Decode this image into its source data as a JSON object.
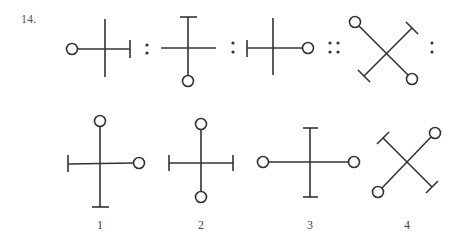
{
  "question": {
    "number": "14.",
    "stroke_color": "#333333",
    "background": "#ffffff"
  },
  "analogy": {
    "separators": [
      ":",
      ":",
      "::",
      ":"
    ],
    "figures": [
      {
        "id": "A",
        "description": "plus sign; circle at left end, bar cap at right end, vertical arm plain"
      },
      {
        "id": "B",
        "description": "plus sign; bar cap at top, circle at bottom, horizontal arm plain"
      },
      {
        "id": "C",
        "description": "plus sign; bar cap at left end, circle at right end, vertical arm plain"
      },
      {
        "id": "D",
        "description": "X shape; circles at top-left and bottom-right, bar caps at top-right and bottom-left"
      }
    ]
  },
  "options": [
    {
      "label": "1",
      "description": "plus sign; circle top, bar cap bottom, bar cap left, circle right"
    },
    {
      "label": "2",
      "description": "plus sign; circle top, circle bottom, bar caps left and right"
    },
    {
      "label": "3",
      "description": "plus sign; bar caps top and bottom, circles left and right"
    },
    {
      "label": "4",
      "description": "X shape; circles at top-right and bottom-left, bar caps at top-left and bottom-right"
    }
  ]
}
